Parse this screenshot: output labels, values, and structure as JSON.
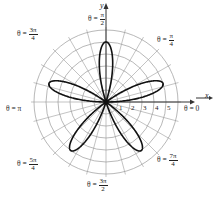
{
  "chart_data": {
    "type": "line",
    "subtype": "polar",
    "title": "",
    "equation_form": "rose curve, 5 petals",
    "r_max": 5,
    "petals": 5,
    "petal_angles_deg": [
      18,
      90,
      162,
      234,
      306
    ],
    "radial_ticks": [
      "1",
      "2",
      "3",
      "4",
      "5"
    ],
    "radial_circles": [
      1,
      2,
      3,
      4,
      5,
      6
    ],
    "spoke_step_deg": 15,
    "xlabel": "x",
    "ylabel": "y",
    "angle_labels": [
      {
        "id": "pi_over_2",
        "prefix": "θ =",
        "num": "π",
        "den": "2"
      },
      {
        "id": "pi_over_4",
        "prefix": "θ =",
        "num": "π",
        "den": "4"
      },
      {
        "id": "three_pi_over_4",
        "prefix": "θ =",
        "num": "3π",
        "den": "4"
      },
      {
        "id": "pi",
        "prefix": "θ =",
        "text": "π"
      },
      {
        "id": "zero",
        "prefix": "θ =",
        "text": "0"
      },
      {
        "id": "five_pi_over_4",
        "prefix": "θ =",
        "num": "5π",
        "den": "4"
      },
      {
        "id": "seven_pi_over_4",
        "prefix": "θ =",
        "num": "7π",
        "den": "4"
      },
      {
        "id": "three_pi_over_2",
        "prefix": "θ =",
        "num": "3π",
        "den": "2"
      }
    ],
    "colors": {
      "grid": "#9a9a9a",
      "curve": "#111111",
      "axis": "#333333"
    }
  }
}
